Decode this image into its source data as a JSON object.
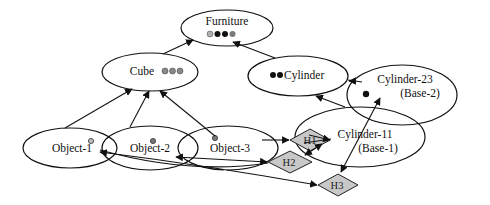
{
  "nodes": {
    "furniture": {
      "label": "Furniture",
      "dots": [
        "#b0b0b0",
        "#111111",
        "#111111",
        "#7a7a7a"
      ]
    },
    "cube": {
      "label": "Cube",
      "dots": [
        "#8a8a8a",
        "#8a8a8a",
        "#8a8a8a"
      ]
    },
    "cylinder": {
      "label": "Cylinder",
      "dots": [
        "#111111",
        "#111111"
      ]
    },
    "cylinder23": {
      "label": "Cylinder-23",
      "sublabel": "(Base-2)"
    },
    "cylinder11": {
      "label": "Cylinder-11",
      "sublabel": "(Base-1)"
    },
    "object1": {
      "label": "Object-1"
    },
    "object2": {
      "label": "Object-2"
    },
    "object3": {
      "label": "Object-3"
    }
  },
  "hypotheses": {
    "h1": {
      "label": "H1"
    },
    "h2": {
      "label": "H2"
    },
    "h3": {
      "label": "H3"
    }
  },
  "edges": [
    {
      "from": "cube",
      "to": "furniture"
    },
    {
      "from": "cylinder",
      "to": "furniture"
    },
    {
      "from": "object1",
      "to": "cube"
    },
    {
      "from": "object2",
      "to": "cube"
    },
    {
      "from": "object3",
      "to": "cube"
    },
    {
      "from": "cylinder11",
      "to": "cylinder"
    },
    {
      "from": "cylinder23",
      "to": "cylinder"
    },
    {
      "from": "object3",
      "to": "h1"
    },
    {
      "from": "h1",
      "to": "cylinder11"
    },
    {
      "from": "object2",
      "to": "h2"
    },
    {
      "from": "h2",
      "to": "cylinder11"
    },
    {
      "from": "object1",
      "to": "h3"
    },
    {
      "from": "h3",
      "to": "cylinder23"
    },
    {
      "from": "h2",
      "to": "object2"
    },
    {
      "from": "h3",
      "to": "object1"
    },
    {
      "from": "cylinder11",
      "to": "h3"
    }
  ],
  "colors": {
    "diamond_fill": "#c8c8c8",
    "stroke": "#111111"
  }
}
